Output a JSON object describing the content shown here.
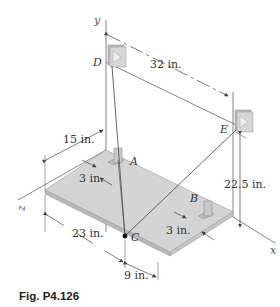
{
  "figure": {
    "caption": "Fig. P4.126",
    "axes": {
      "x": "x",
      "y": "y",
      "z": "z"
    },
    "points": {
      "A": "A",
      "B": "B",
      "C": "C",
      "D": "D",
      "E": "E"
    },
    "dimensions": {
      "de_span": "32 in.",
      "left_depth": "15 in.",
      "a_offset": "3 in.",
      "front_length": "23 in.",
      "c_offset": "9 in.",
      "b_offset": "3 in.",
      "e_height": "22.5 in."
    },
    "colors": {
      "plate_top": "#d4d4d4",
      "plate_edge": "#b8b8b8",
      "bracket": "#c8c8c8",
      "line": "#555555"
    }
  }
}
